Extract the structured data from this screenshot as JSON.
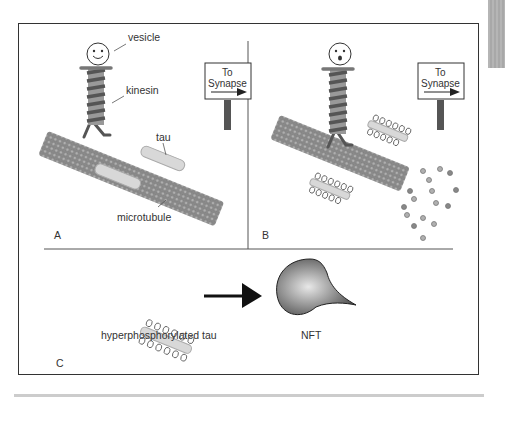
{
  "figure": {
    "panels": [
      {
        "id": "A",
        "label": "A",
        "sign": {
          "line1": "To",
          "line2": "Synapse"
        },
        "annotations": {
          "vesicle": "vesicle",
          "kinesin": "kinesin",
          "tau": "tau",
          "microtubule": "microtubule"
        },
        "vesicle_expression": "smiling"
      },
      {
        "id": "B",
        "label": "B",
        "sign": {
          "line1": "To",
          "line2": "Synapse"
        },
        "vesicle_expression": "surprised"
      },
      {
        "id": "C",
        "label": "C",
        "items": {
          "left_label": "hyperphosphorylated tau",
          "right_label": "NFT"
        }
      }
    ],
    "colors": {
      "border": "#333333",
      "kinesin_dark": "#555555",
      "kinesin_light": "#999999",
      "microtubule": "#8a8a8a",
      "tau": "#d8d8d8",
      "sign_post": "#555555"
    }
  }
}
